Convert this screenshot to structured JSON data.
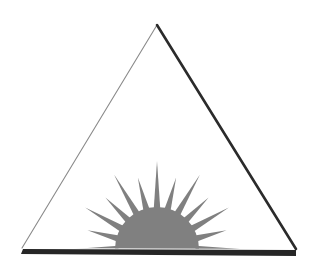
{
  "canvas": {
    "width": 317,
    "height": 272,
    "background_color": "#ffffff",
    "title": "Sunburst Triangle Emblem"
  },
  "artwork": {
    "name": "rising-sun-in-triangle",
    "description": "Line-art triangle outline containing a gray half-sun burst resting on a thick dark baseline bar"
  },
  "triangle": {
    "name": "triangle-outline",
    "apex": {
      "x": 157,
      "y": 25
    },
    "bottom_left": {
      "x": 22,
      "y": 248
    },
    "bottom_right": {
      "x": 296,
      "y": 249
    },
    "left_edge": {
      "name": "left-edge",
      "color": "#8a8a8a",
      "stroke_width": 1.1
    },
    "right_edge": {
      "name": "right-edge",
      "color": "#2b2b2b",
      "stroke_width": 2.6
    },
    "fill": "#ffffff"
  },
  "baseline_bar": {
    "name": "baseline-bar",
    "color": "#262626",
    "points": "23,249 296,250 296,256 21,254",
    "thickness": 5
  },
  "sunburst": {
    "name": "sun-burst",
    "center": {
      "x": 157,
      "y": 249
    },
    "color": "#808080",
    "core": {
      "name": "sun-core-disc",
      "radius": 42,
      "color": "#808080"
    },
    "ray_count": 13,
    "ray_half_width_deg": 5.0,
    "rays": [
      {
        "angle_deg": 180,
        "length": 83
      },
      {
        "angle_deg": 165,
        "length": 72
      },
      {
        "angle_deg": 150,
        "length": 83
      },
      {
        "angle_deg": 135,
        "length": 73
      },
      {
        "angle_deg": 120,
        "length": 86
      },
      {
        "angle_deg": 105,
        "length": 74
      },
      {
        "angle_deg": 90,
        "length": 88
      },
      {
        "angle_deg": 75,
        "length": 74
      },
      {
        "angle_deg": 60,
        "length": 86
      },
      {
        "angle_deg": 45,
        "length": 73
      },
      {
        "angle_deg": 30,
        "length": 83
      },
      {
        "angle_deg": 15,
        "length": 72
      },
      {
        "angle_deg": 0,
        "length": 83
      }
    ]
  },
  "colors": {
    "background": "#ffffff",
    "sun_gray": "#808080",
    "dark_ink": "#262626",
    "light_ink": "#8a8a8a"
  }
}
